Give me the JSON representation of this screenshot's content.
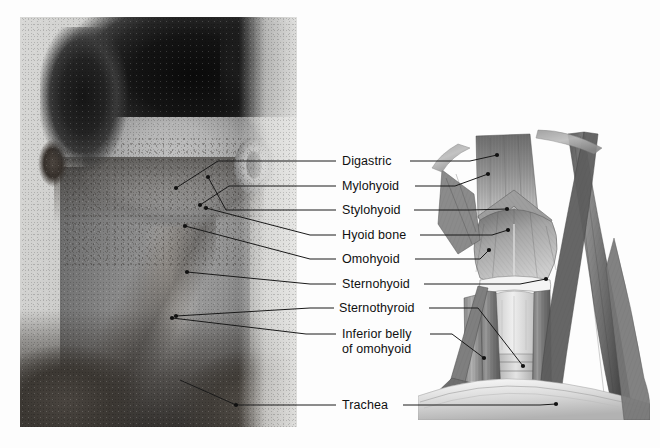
{
  "figure": {
    "domain": "anatomy-plate",
    "title_caption": "",
    "panels": {
      "photo": {
        "name": "surface-anatomy-photograph",
        "description": "Grayscale photograph of a young man with head tilted back showing the anterior neck",
        "subject": "anterior neck, surface anatomy"
      },
      "illustration": {
        "name": "neck-muscle-illustration",
        "description": "Pencil-shaded anatomical drawing of the anterior neck musculature",
        "subject": "suprahyoid and infrahyoid muscles, trachea"
      }
    }
  },
  "labels": [
    {
      "id": "digastric",
      "text": "Digastric",
      "line2": "",
      "x": 342,
      "y": 154,
      "leader_y": 161,
      "text_right": 404
    },
    {
      "id": "mylohyoid",
      "text": "Mylohyoid",
      "line2": "",
      "x": 342,
      "y": 179,
      "leader_y": 186,
      "text_right": 409
    },
    {
      "id": "stylohyoid",
      "text": "Stylohyoid",
      "line2": "",
      "x": 342,
      "y": 203,
      "leader_y": 210,
      "text_right": 408
    },
    {
      "id": "hyoid-bone",
      "text": "Hyoid bone",
      "line2": "",
      "x": 342,
      "y": 228,
      "leader_y": 235,
      "text_right": 414
    },
    {
      "id": "omohyoid",
      "text": "Omohyoid",
      "line2": "",
      "x": 342,
      "y": 252,
      "leader_y": 259,
      "text_right": 409
    },
    {
      "id": "sternohyoid",
      "text": "Sternohyoid",
      "line2": "",
      "x": 342,
      "y": 277,
      "leader_y": 284,
      "text_right": 418
    },
    {
      "id": "sternothyroid",
      "text": "Sternothyroid",
      "line2": "",
      "x": 339,
      "y": 301,
      "leader_y": 308,
      "text_right": 423
    },
    {
      "id": "inferior-belly",
      "text": "Inferior belly",
      "line2": "of omohyoid",
      "x": 342,
      "y": 327,
      "leader_y": 334,
      "text_right": 424
    },
    {
      "id": "trachea",
      "text": "Trachea",
      "line2": "",
      "x": 342,
      "y": 398,
      "leader_y": 405,
      "text_right": 397
    }
  ],
  "leaders": {
    "label_column_left": 342,
    "stroke_color": "#1a1a1a",
    "stroke_width": 1,
    "photo_side": [
      {
        "id": "digastric",
        "points": "336,161 310,161 218,161 176,188",
        "dot": "176,188"
      },
      {
        "id": "mylohyoid",
        "points": "336,186 310,186 229,186 200,205",
        "dot": "200,205"
      },
      {
        "id": "stylohyoid",
        "points": "336,210 310,210 226,210 208,177",
        "dot": "208,177"
      },
      {
        "id": "hyoid-bone",
        "points": "336,235 310,235 206,208",
        "dot": "206,208"
      },
      {
        "id": "omohyoid",
        "points": "336,259 310,259 185,226",
        "dot": "185,226"
      },
      {
        "id": "sternohyoid",
        "points": "336,284 310,284 187,272",
        "dot": "187,272"
      },
      {
        "id": "sternothyroid",
        "points": "334,308 310,308 176,316",
        "dot": "176,316"
      },
      {
        "id": "inferior-belly",
        "points": "336,334 306,334 172,318",
        "dot": "172,318"
      },
      {
        "id": "trachea",
        "points": "336,405 310,405 236,405 180,380",
        "dot": "236,405"
      }
    ],
    "art_side": [
      {
        "id": "digastric",
        "points": "410,161 470,161 497,155",
        "dot": "497,155"
      },
      {
        "id": "mylohyoid",
        "points": "415,186 455,186 488,174",
        "dot": "488,174"
      },
      {
        "id": "stylohyoid",
        "points": "414,210 470,210 507,209",
        "dot": "507,209"
      },
      {
        "id": "hyoid-bone",
        "points": "420,235 492,235 508,230",
        "dot": "508,230"
      },
      {
        "id": "omohyoid",
        "points": "415,259 480,259 489,250",
        "dot": "489,250"
      },
      {
        "id": "sternohyoid",
        "points": "424,284 520,284 546,279",
        "dot": "546,279"
      },
      {
        "id": "sternothyroid",
        "points": "429,308 478,308 523,366",
        "dot": "523,366"
      },
      {
        "id": "inferior-belly",
        "points": "430,334 452,334 484,358",
        "dot": "484,358"
      },
      {
        "id": "trachea",
        "points": "403,405 540,405 556,404",
        "dot": "556,404"
      }
    ]
  },
  "anatomy_terms": {
    "suprahyoid": [
      "Digastric",
      "Mylohyoid",
      "Stylohyoid"
    ],
    "infrahyoid": [
      "Omohyoid",
      "Sternohyoid",
      "Sternothyroid",
      "Inferior belly of omohyoid"
    ],
    "skeletal": [
      "Hyoid bone"
    ],
    "airway": [
      "Trachea"
    ]
  },
  "colors": {
    "label_text": "#101010",
    "leader_line": "#1a1a1a",
    "page_background": "#ffffff",
    "art_ink_dark": "#3b3b3b",
    "art_ink_mid": "#8c8c8c",
    "art_ink_light": "#d2d2d2"
  }
}
